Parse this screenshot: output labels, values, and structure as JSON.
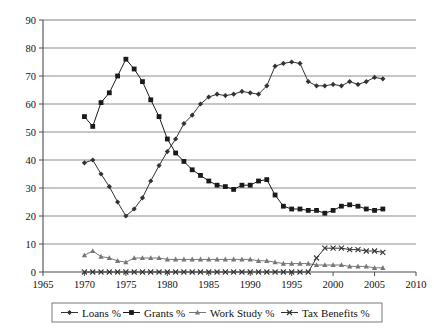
{
  "chart_data": {
    "type": "line",
    "title": "",
    "xlabel": "",
    "ylabel": "",
    "xlim": [
      1965,
      2010
    ],
    "ylim": [
      0,
      90
    ],
    "xticks": [
      1965,
      1970,
      1975,
      1980,
      1985,
      1990,
      1995,
      2000,
      2005,
      2010
    ],
    "yticks": [
      0,
      10,
      20,
      30,
      40,
      50,
      60,
      70,
      80,
      90
    ],
    "grid": "horizontal",
    "legend_position": "bottom",
    "x": [
      1970,
      1971,
      1972,
      1973,
      1974,
      1975,
      1976,
      1977,
      1978,
      1979,
      1980,
      1981,
      1982,
      1983,
      1984,
      1985,
      1986,
      1987,
      1988,
      1989,
      1990,
      1991,
      1992,
      1993,
      1994,
      1995,
      1996,
      1997,
      1998,
      1999,
      2000,
      2001,
      2002,
      2003,
      2004,
      2005,
      2006
    ],
    "series": [
      {
        "name": "Loans %",
        "marker": "diamond",
        "color": "#333333",
        "values": [
          39,
          40,
          35,
          30.5,
          25,
          20,
          22.5,
          26.5,
          32.5,
          38,
          43,
          47.5,
          53,
          56,
          60,
          62.5,
          63.5,
          63,
          63.5,
          64.5,
          64,
          63.5,
          66.5,
          73.5,
          74.5,
          75,
          74.5,
          68,
          66.5,
          66.5,
          67,
          66.5,
          68,
          67,
          68,
          69.5,
          69
        ]
      },
      {
        "name": "Grants %",
        "marker": "square",
        "color": "#1a1a1a",
        "values": [
          55.5,
          52,
          60.5,
          64,
          70,
          76,
          72.5,
          68,
          61.5,
          55.5,
          47.5,
          42.5,
          39.5,
          36.5,
          34.5,
          32.5,
          31,
          30.5,
          29.5,
          31,
          31,
          32.5,
          33,
          27.5,
          23.5,
          22.5,
          22.5,
          22,
          22,
          21,
          22,
          23.5,
          24,
          23.5,
          22.5,
          22,
          22.5
        ]
      },
      {
        "name": "Work Study %",
        "marker": "triangle",
        "color": "#777777",
        "values": [
          6,
          7.5,
          5.5,
          5,
          4,
          3.5,
          5,
          5,
          5,
          5,
          4.5,
          4.5,
          4.5,
          4.5,
          4.5,
          4.5,
          4.5,
          4.5,
          4.5,
          4.5,
          4.5,
          4,
          4,
          3.5,
          3,
          3,
          3,
          3,
          2.5,
          2.5,
          2.5,
          2.5,
          2,
          2,
          2,
          1.5,
          1.5
        ]
      },
      {
        "name": "Tax Benefits %",
        "marker": "x",
        "color": "#333333",
        "values": [
          0,
          0,
          0,
          0,
          0,
          0,
          0,
          0,
          0,
          0,
          0,
          0,
          0,
          0,
          0,
          0,
          0,
          0,
          0,
          0,
          0,
          0,
          0,
          0,
          0,
          0,
          0,
          0,
          5,
          8.5,
          8.5,
          8.5,
          8,
          8,
          7.5,
          7.5,
          7
        ]
      }
    ]
  },
  "legend": {
    "items": [
      {
        "label": "Loans %"
      },
      {
        "label": "Grants %"
      },
      {
        "label": "Work Study %"
      },
      {
        "label": "Tax Benefits %"
      }
    ]
  },
  "colors": {
    "axis": "#4d4d4d",
    "grid": "#808080",
    "frame": "#555555",
    "text": "#111111"
  }
}
